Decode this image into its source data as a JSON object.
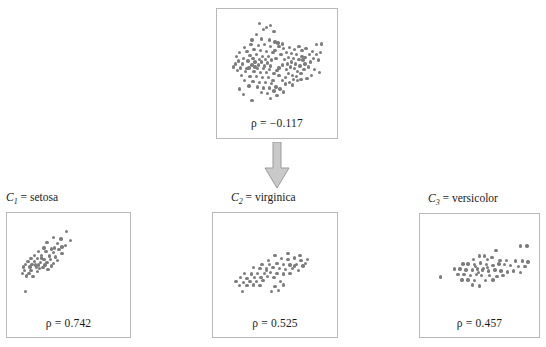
{
  "figure": {
    "type": "scatter-matrix-decomposition",
    "arrow_icon": "down-arrow-icon",
    "dot_color": "#7c7c7c",
    "frame_color": "#b9b9b9"
  },
  "panels": {
    "top": {
      "name": "aggregate-scatter",
      "rho_symbol": "ρ",
      "rho_eq": "=",
      "rho_value": "−0.117",
      "rho_label": "ρ = −0.117"
    },
    "c1": {
      "name": "cluster-1-scatter",
      "cluster_symbol": "C",
      "cluster_index": "1",
      "cluster_eq": "=",
      "cluster_name": "setosa",
      "label": "C₁ = setosa",
      "rho_symbol": "ρ",
      "rho_eq": "=",
      "rho_value": "0.742",
      "rho_label": "ρ = 0.742"
    },
    "c2": {
      "name": "cluster-2-scatter",
      "cluster_symbol": "C",
      "cluster_index": "2",
      "cluster_eq": "=",
      "cluster_name": "virginica",
      "label": "C₂ = virginica",
      "rho_symbol": "ρ",
      "rho_eq": "=",
      "rho_value": "0.525",
      "rho_label": "ρ = 0.525"
    },
    "c3": {
      "name": "cluster-3-scatter",
      "cluster_symbol": "C",
      "cluster_index": "3",
      "cluster_eq": "=",
      "cluster_name": "versicolor",
      "label": "C₃ = versicolor",
      "rho_symbol": "ρ",
      "rho_eq": "=",
      "rho_value": "0.457",
      "rho_label": "ρ = 0.457"
    }
  },
  "chart_data": [
    {
      "type": "scatter",
      "id": "top",
      "title": "",
      "xlabel": "",
      "ylabel": "",
      "annotation": "ρ = −0.117",
      "correlation": -0.117,
      "grid": false,
      "legend": "none",
      "xlim": [
        0,
        1
      ],
      "ylim": [
        0,
        1
      ],
      "points": [
        [
          0.4,
          0.88
        ],
        [
          0.3,
          0.81
        ],
        [
          0.47,
          0.84
        ],
        [
          0.35,
          0.76
        ],
        [
          0.43,
          0.75
        ],
        [
          0.51,
          0.72
        ],
        [
          0.25,
          0.7
        ],
        [
          0.32,
          0.69
        ],
        [
          0.38,
          0.7
        ],
        [
          0.44,
          0.68
        ],
        [
          0.28,
          0.65
        ],
        [
          0.21,
          0.63
        ],
        [
          0.34,
          0.64
        ],
        [
          0.4,
          0.63
        ],
        [
          0.46,
          0.62
        ],
        [
          0.3,
          0.6
        ],
        [
          0.24,
          0.59
        ],
        [
          0.36,
          0.58
        ],
        [
          0.42,
          0.58
        ],
        [
          0.18,
          0.56
        ],
        [
          0.27,
          0.56
        ],
        [
          0.33,
          0.55
        ],
        [
          0.39,
          0.55
        ],
        [
          0.45,
          0.54
        ],
        [
          0.13,
          0.53
        ],
        [
          0.22,
          0.53
        ],
        [
          0.29,
          0.52
        ],
        [
          0.35,
          0.52
        ],
        [
          0.41,
          0.51
        ],
        [
          0.49,
          0.56
        ],
        [
          0.1,
          0.5
        ],
        [
          0.17,
          0.5
        ],
        [
          0.26,
          0.49
        ],
        [
          0.32,
          0.49
        ],
        [
          0.38,
          0.48
        ],
        [
          0.44,
          0.48
        ],
        [
          0.08,
          0.47
        ],
        [
          0.15,
          0.46
        ],
        [
          0.23,
          0.46
        ],
        [
          0.31,
          0.45
        ],
        [
          0.37,
          0.45
        ],
        [
          0.43,
          0.44
        ],
        [
          0.12,
          0.43
        ],
        [
          0.2,
          0.42
        ],
        [
          0.28,
          0.42
        ],
        [
          0.34,
          0.41
        ],
        [
          0.4,
          0.41
        ],
        [
          0.47,
          0.4
        ],
        [
          0.16,
          0.38
        ],
        [
          0.24,
          0.37
        ],
        [
          0.3,
          0.37
        ],
        [
          0.36,
          0.36
        ],
        [
          0.42,
          0.36
        ],
        [
          0.52,
          0.38
        ],
        [
          0.19,
          0.33
        ],
        [
          0.27,
          0.32
        ],
        [
          0.33,
          0.31
        ],
        [
          0.39,
          0.31
        ],
        [
          0.45,
          0.3
        ],
        [
          0.55,
          0.33
        ],
        [
          0.23,
          0.27
        ],
        [
          0.31,
          0.26
        ],
        [
          0.37,
          0.25
        ],
        [
          0.43,
          0.25
        ],
        [
          0.49,
          0.26
        ],
        [
          0.58,
          0.29
        ],
        [
          0.14,
          0.24
        ],
        [
          0.35,
          0.2
        ],
        [
          0.41,
          0.19
        ],
        [
          0.47,
          0.22
        ],
        [
          0.53,
          0.24
        ],
        [
          0.62,
          0.31
        ],
        [
          0.18,
          0.18
        ],
        [
          0.44,
          0.14
        ],
        [
          0.5,
          0.17
        ],
        [
          0.56,
          0.21
        ],
        [
          0.65,
          0.28
        ],
        [
          0.26,
          0.12
        ],
        [
          0.59,
          0.44
        ],
        [
          0.63,
          0.47
        ],
        [
          0.67,
          0.45
        ],
        [
          0.7,
          0.42
        ],
        [
          0.73,
          0.4
        ],
        [
          0.76,
          0.44
        ],
        [
          0.6,
          0.5
        ],
        [
          0.64,
          0.52
        ],
        [
          0.68,
          0.5
        ],
        [
          0.72,
          0.48
        ],
        [
          0.77,
          0.5
        ],
        [
          0.8,
          0.47
        ],
        [
          0.57,
          0.55
        ],
        [
          0.61,
          0.57
        ],
        [
          0.66,
          0.56
        ],
        [
          0.71,
          0.55
        ],
        [
          0.75,
          0.54
        ],
        [
          0.82,
          0.52
        ],
        [
          0.54,
          0.6
        ],
        [
          0.59,
          0.62
        ],
        [
          0.64,
          0.61
        ],
        [
          0.69,
          0.6
        ],
        [
          0.74,
          0.58
        ],
        [
          0.85,
          0.56
        ],
        [
          0.56,
          0.66
        ],
        [
          0.62,
          0.67
        ],
        [
          0.67,
          0.65
        ],
        [
          0.88,
          0.7
        ],
        [
          0.93,
          0.71
        ],
        [
          0.9,
          0.54
        ],
        [
          0.86,
          0.44
        ],
        [
          0.91,
          0.41
        ],
        [
          0.83,
          0.38
        ],
        [
          0.79,
          0.35
        ],
        [
          0.7,
          0.33
        ],
        [
          0.66,
          0.34
        ],
        [
          0.52,
          0.46
        ],
        [
          0.55,
          0.49
        ],
        [
          0.48,
          0.64
        ],
        [
          0.5,
          0.43
        ],
        [
          0.46,
          0.33
        ],
        [
          0.58,
          0.36
        ],
        [
          0.61,
          0.4
        ],
        [
          0.65,
          0.38
        ],
        [
          0.69,
          0.37
        ],
        [
          0.73,
          0.34
        ],
        [
          0.77,
          0.57
        ],
        [
          0.81,
          0.6
        ],
        [
          0.44,
          0.9
        ],
        [
          0.37,
          0.86
        ],
        [
          0.33,
          0.92
        ],
        [
          0.29,
          0.47
        ],
        [
          0.21,
          0.45
        ],
        [
          0.11,
          0.58
        ],
        [
          0.52,
          0.68
        ],
        [
          0.55,
          0.71
        ],
        [
          0.48,
          0.73
        ],
        [
          0.26,
          0.75
        ],
        [
          0.19,
          0.67
        ],
        [
          0.14,
          0.62
        ],
        [
          0.84,
          0.63
        ],
        [
          0.88,
          0.6
        ],
        [
          0.92,
          0.62
        ],
        [
          0.78,
          0.66
        ],
        [
          0.74,
          0.64
        ],
        [
          0.71,
          0.68
        ]
      ]
    },
    {
      "type": "scatter",
      "id": "c1",
      "title": "C₁ = setosa",
      "xlabel": "",
      "ylabel": "",
      "annotation": "ρ = 0.742",
      "correlation": 0.742,
      "grid": false,
      "legend": "none",
      "xlim": [
        0,
        1
      ],
      "ylim": [
        0,
        1
      ],
      "points": [
        [
          0.48,
          0.88
        ],
        [
          0.36,
          0.82
        ],
        [
          0.43,
          0.8
        ],
        [
          0.52,
          0.78
        ],
        [
          0.3,
          0.76
        ],
        [
          0.4,
          0.75
        ],
        [
          0.47,
          0.73
        ],
        [
          0.27,
          0.7
        ],
        [
          0.34,
          0.69
        ],
        [
          0.41,
          0.68
        ],
        [
          0.22,
          0.66
        ],
        [
          0.29,
          0.66
        ],
        [
          0.36,
          0.65
        ],
        [
          0.44,
          0.64
        ],
        [
          0.18,
          0.62
        ],
        [
          0.25,
          0.62
        ],
        [
          0.32,
          0.61
        ],
        [
          0.38,
          0.6
        ],
        [
          0.15,
          0.58
        ],
        [
          0.21,
          0.58
        ],
        [
          0.27,
          0.57
        ],
        [
          0.33,
          0.57
        ],
        [
          0.4,
          0.56
        ],
        [
          0.12,
          0.55
        ],
        [
          0.18,
          0.55
        ],
        [
          0.24,
          0.54
        ],
        [
          0.3,
          0.54
        ],
        [
          0.36,
          0.53
        ],
        [
          0.1,
          0.52
        ],
        [
          0.16,
          0.52
        ],
        [
          0.22,
          0.51
        ],
        [
          0.28,
          0.51
        ],
        [
          0.34,
          0.5
        ],
        [
          0.08,
          0.49
        ],
        [
          0.14,
          0.49
        ],
        [
          0.2,
          0.48
        ],
        [
          0.26,
          0.48
        ],
        [
          0.09,
          0.45
        ],
        [
          0.15,
          0.45
        ],
        [
          0.21,
          0.44
        ],
        [
          0.07,
          0.42
        ],
        [
          0.13,
          0.42
        ],
        [
          0.11,
          0.39
        ],
        [
          0.17,
          0.38
        ],
        [
          0.23,
          0.47
        ],
        [
          0.31,
          0.46
        ],
        [
          0.19,
          0.51
        ],
        [
          0.25,
          0.59
        ],
        [
          0.1,
          0.22
        ],
        [
          0.37,
          0.7
        ],
        [
          0.44,
          0.71
        ]
      ]
    },
    {
      "type": "scatter",
      "id": "c2",
      "title": "C₂ = virginica",
      "xlabel": "",
      "ylabel": "",
      "annotation": "ρ = 0.525",
      "correlation": 0.525,
      "grid": false,
      "legend": "none",
      "xlim": [
        0,
        1
      ],
      "ylim": [
        0,
        1
      ],
      "points": [
        [
          0.5,
          0.62
        ],
        [
          0.44,
          0.56
        ],
        [
          0.56,
          0.58
        ],
        [
          0.62,
          0.57
        ],
        [
          0.68,
          0.59
        ],
        [
          0.74,
          0.56
        ],
        [
          0.8,
          0.57
        ],
        [
          0.38,
          0.52
        ],
        [
          0.45,
          0.52
        ],
        [
          0.52,
          0.53
        ],
        [
          0.58,
          0.52
        ],
        [
          0.64,
          0.51
        ],
        [
          0.7,
          0.52
        ],
        [
          0.76,
          0.5
        ],
        [
          0.3,
          0.48
        ],
        [
          0.36,
          0.47
        ],
        [
          0.42,
          0.47
        ],
        [
          0.48,
          0.48
        ],
        [
          0.54,
          0.47
        ],
        [
          0.6,
          0.46
        ],
        [
          0.66,
          0.47
        ],
        [
          0.72,
          0.45
        ],
        [
          0.22,
          0.42
        ],
        [
          0.28,
          0.41
        ],
        [
          0.34,
          0.42
        ],
        [
          0.4,
          0.42
        ],
        [
          0.46,
          0.43
        ],
        [
          0.52,
          0.42
        ],
        [
          0.58,
          0.41
        ],
        [
          0.64,
          0.42
        ],
        [
          0.18,
          0.37
        ],
        [
          0.24,
          0.36
        ],
        [
          0.31,
          0.37
        ],
        [
          0.37,
          0.37
        ],
        [
          0.43,
          0.38
        ],
        [
          0.49,
          0.37
        ],
        [
          0.14,
          0.33
        ],
        [
          0.21,
          0.32
        ],
        [
          0.27,
          0.33
        ],
        [
          0.33,
          0.33
        ],
        [
          0.39,
          0.34
        ],
        [
          0.55,
          0.33
        ],
        [
          0.17,
          0.28
        ],
        [
          0.24,
          0.28
        ],
        [
          0.3,
          0.29
        ],
        [
          0.36,
          0.28
        ],
        [
          0.5,
          0.27
        ],
        [
          0.58,
          0.29
        ],
        [
          0.2,
          0.22
        ],
        [
          0.47,
          0.22
        ],
        [
          0.53,
          0.23
        ],
        [
          0.42,
          0.45
        ],
        [
          0.62,
          0.64
        ],
        [
          0.68,
          0.5
        ],
        [
          0.73,
          0.62
        ],
        [
          0.78,
          0.53
        ]
      ]
    },
    {
      "type": "scatter",
      "id": "c3",
      "title": "C₃ = versicolor",
      "xlabel": "",
      "ylabel": "",
      "annotation": "ρ = 0.457",
      "correlation": 0.457,
      "grid": false,
      "legend": "none",
      "xlim": [
        0,
        1
      ],
      "ylim": [
        0,
        1
      ],
      "points": [
        [
          0.9,
          0.73
        ],
        [
          0.96,
          0.73
        ],
        [
          0.66,
          0.68
        ],
        [
          0.5,
          0.62
        ],
        [
          0.55,
          0.62
        ],
        [
          0.44,
          0.58
        ],
        [
          0.58,
          0.58
        ],
        [
          0.62,
          0.6
        ],
        [
          0.7,
          0.57
        ],
        [
          0.76,
          0.57
        ],
        [
          0.85,
          0.56
        ],
        [
          0.92,
          0.56
        ],
        [
          0.97,
          0.55
        ],
        [
          0.34,
          0.53
        ],
        [
          0.39,
          0.53
        ],
        [
          0.45,
          0.52
        ],
        [
          0.51,
          0.54
        ],
        [
          0.57,
          0.52
        ],
        [
          0.63,
          0.51
        ],
        [
          0.69,
          0.53
        ],
        [
          0.74,
          0.52
        ],
        [
          0.8,
          0.51
        ],
        [
          0.88,
          0.5
        ],
        [
          0.94,
          0.5
        ],
        [
          0.26,
          0.47
        ],
        [
          0.31,
          0.47
        ],
        [
          0.37,
          0.46
        ],
        [
          0.43,
          0.46
        ],
        [
          0.48,
          0.47
        ],
        [
          0.53,
          0.46
        ],
        [
          0.59,
          0.45
        ],
        [
          0.65,
          0.46
        ],
        [
          0.71,
          0.45
        ],
        [
          0.77,
          0.44
        ],
        [
          0.83,
          0.45
        ],
        [
          0.9,
          0.43
        ],
        [
          0.29,
          0.41
        ],
        [
          0.35,
          0.41
        ],
        [
          0.41,
          0.4
        ],
        [
          0.47,
          0.41
        ],
        [
          0.52,
          0.4
        ],
        [
          0.6,
          0.4
        ],
        [
          0.67,
          0.39
        ],
        [
          0.73,
          0.4
        ],
        [
          0.12,
          0.38
        ],
        [
          0.33,
          0.35
        ],
        [
          0.39,
          0.35
        ],
        [
          0.45,
          0.34
        ],
        [
          0.56,
          0.34
        ],
        [
          0.63,
          0.35
        ],
        [
          0.43,
          0.29
        ],
        [
          0.5,
          0.28
        ],
        [
          0.49,
          0.43
        ],
        [
          0.54,
          0.48
        ],
        [
          0.46,
          0.5
        ],
        [
          0.58,
          0.49
        ]
      ]
    }
  ]
}
